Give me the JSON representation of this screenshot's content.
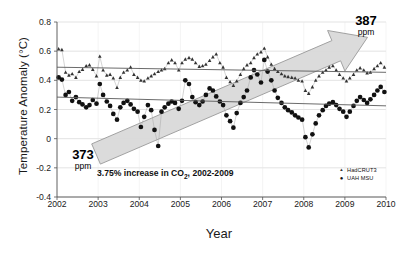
{
  "chart_data": {
    "type": "scatter",
    "title": "",
    "xlabel": "Year",
    "ylabel": "Temperature Anomaly (°C)",
    "xlim": [
      2002,
      2010
    ],
    "ylim": [
      -0.4,
      0.8
    ],
    "xticks": [
      "2002",
      "2003",
      "2004",
      "2005",
      "2006",
      "2007",
      "2008",
      "2009",
      "2010"
    ],
    "yticks": [
      "0.8",
      "0.6",
      "0.4",
      "0.2",
      "0",
      "-0.2",
      "-0.4"
    ],
    "grid": true,
    "legend_position": "bottom-right",
    "legend": [
      {
        "label": "HadCRUT3",
        "marker": "small-triangle",
        "color": "#333333"
      },
      {
        "label": "UAH MSU",
        "marker": "filled-circle",
        "color": "#111111"
      }
    ],
    "annotations": [
      {
        "name": "co2-start",
        "value": "373",
        "unit": "ppm",
        "text": "373 ppm"
      },
      {
        "name": "co2-end",
        "value": "387",
        "unit": "ppm",
        "text": "387 ppm"
      },
      {
        "name": "caption",
        "text": "3.75% increase in CO2, 2002-2009",
        "prefix": "3.75% increase in CO",
        "sub": "2",
        "suffix": ", 2002-2009"
      }
    ],
    "arrow": {
      "label": "co2-increase-arrow",
      "from": [
        2002.95,
        -0.105
      ],
      "to": [
        2009.55,
        0.695
      ],
      "color": "#d9d9d9"
    },
    "trendlines": [
      {
        "series": "HadCRUT3",
        "from": [
          2002,
          0.49
        ],
        "to": [
          2010,
          0.455
        ],
        "color": "#5a5a5a"
      },
      {
        "series": "UAH MSU",
        "from": [
          2002,
          0.285
        ],
        "to": [
          2010,
          0.225
        ],
        "color": "#5a5a5a"
      }
    ],
    "series": [
      {
        "name": "HadCRUT3",
        "marker": "small-triangle",
        "color": "#333333",
        "x": [
          2002.04,
          2002.12,
          2002.21,
          2002.29,
          2002.37,
          2002.46,
          2002.54,
          2002.62,
          2002.71,
          2002.79,
          2002.87,
          2002.96,
          2003.04,
          2003.12,
          2003.21,
          2003.29,
          2003.37,
          2003.46,
          2003.54,
          2003.62,
          2003.71,
          2003.79,
          2003.87,
          2003.96,
          2004.04,
          2004.12,
          2004.21,
          2004.29,
          2004.37,
          2004.46,
          2004.54,
          2004.62,
          2004.71,
          2004.79,
          2004.87,
          2004.96,
          2005.04,
          2005.12,
          2005.21,
          2005.29,
          2005.37,
          2005.46,
          2005.54,
          2005.62,
          2005.71,
          2005.79,
          2005.87,
          2005.96,
          2006.04,
          2006.12,
          2006.21,
          2006.29,
          2006.37,
          2006.46,
          2006.54,
          2006.62,
          2006.71,
          2006.79,
          2006.87,
          2006.96,
          2007.04,
          2007.12,
          2007.21,
          2007.29,
          2007.37,
          2007.46,
          2007.54,
          2007.62,
          2007.71,
          2007.79,
          2007.87,
          2007.96,
          2008.04,
          2008.12,
          2008.21,
          2008.29,
          2008.37,
          2008.46,
          2008.54,
          2008.62,
          2008.71,
          2008.79,
          2008.87,
          2008.96,
          2009.04,
          2009.12,
          2009.21,
          2009.29,
          2009.37,
          2009.46,
          2009.54,
          2009.62,
          2009.71,
          2009.79,
          2009.87,
          2009.96
        ],
        "y": [
          0.615,
          0.61,
          0.455,
          0.435,
          0.445,
          0.42,
          0.46,
          0.475,
          0.5,
          0.505,
          0.475,
          0.43,
          0.565,
          0.47,
          0.435,
          0.44,
          0.415,
          0.35,
          0.42,
          0.455,
          0.47,
          0.49,
          0.44,
          0.42,
          0.4,
          0.395,
          0.415,
          0.43,
          0.445,
          0.46,
          0.47,
          0.48,
          0.52,
          0.54,
          0.52,
          0.47,
          0.52,
          0.545,
          0.555,
          0.545,
          0.52,
          0.495,
          0.5,
          0.51,
          0.535,
          0.56,
          0.58,
          0.52,
          0.49,
          0.42,
          0.39,
          0.365,
          0.395,
          0.44,
          0.48,
          0.505,
          0.52,
          0.555,
          0.58,
          0.595,
          0.62,
          0.56,
          0.51,
          0.48,
          0.46,
          0.445,
          0.43,
          0.425,
          0.42,
          0.415,
          0.4,
          0.395,
          0.33,
          0.31,
          0.355,
          0.4,
          0.43,
          0.455,
          0.47,
          0.49,
          0.5,
          0.47,
          0.44,
          0.415,
          0.395,
          0.415,
          0.44,
          0.47,
          0.485,
          0.47,
          0.45,
          0.455,
          0.48,
          0.5,
          0.52,
          0.49
        ]
      },
      {
        "name": "UAH MSU",
        "marker": "filled-circle",
        "color": "#111111",
        "x": [
          2002.04,
          2002.12,
          2002.21,
          2002.29,
          2002.37,
          2002.46,
          2002.54,
          2002.62,
          2002.71,
          2002.79,
          2002.87,
          2002.96,
          2003.04,
          2003.12,
          2003.21,
          2003.29,
          2003.37,
          2003.46,
          2003.54,
          2003.62,
          2003.71,
          2003.79,
          2003.87,
          2003.96,
          2004.04,
          2004.12,
          2004.21,
          2004.29,
          2004.37,
          2004.46,
          2004.54,
          2004.62,
          2004.71,
          2004.79,
          2004.87,
          2004.96,
          2005.04,
          2005.12,
          2005.21,
          2005.29,
          2005.37,
          2005.46,
          2005.54,
          2005.62,
          2005.71,
          2005.79,
          2005.87,
          2005.96,
          2006.04,
          2006.12,
          2006.21,
          2006.29,
          2006.37,
          2006.46,
          2006.54,
          2006.62,
          2006.71,
          2006.79,
          2006.87,
          2006.96,
          2007.04,
          2007.12,
          2007.21,
          2007.29,
          2007.37,
          2007.46,
          2007.54,
          2007.62,
          2007.71,
          2007.79,
          2007.87,
          2007.96,
          2008.04,
          2008.12,
          2008.21,
          2008.29,
          2008.37,
          2008.46,
          2008.54,
          2008.62,
          2008.71,
          2008.79,
          2008.87,
          2008.96,
          2009.04,
          2009.12,
          2009.21,
          2009.29,
          2009.37,
          2009.46,
          2009.54,
          2009.62,
          2009.71,
          2009.79,
          2009.87,
          2009.96
        ],
        "y": [
          0.42,
          0.405,
          0.3,
          0.32,
          0.26,
          0.285,
          0.25,
          0.235,
          0.215,
          0.23,
          0.265,
          0.24,
          0.375,
          0.3,
          0.255,
          0.225,
          0.17,
          0.13,
          0.215,
          0.245,
          0.26,
          0.235,
          0.205,
          0.185,
          0.08,
          0.15,
          0.23,
          0.195,
          0.06,
          -0.05,
          0.185,
          0.215,
          0.24,
          0.255,
          0.245,
          0.205,
          0.26,
          0.4,
          0.375,
          0.285,
          0.25,
          0.23,
          0.255,
          0.3,
          0.345,
          0.33,
          0.29,
          0.255,
          0.23,
          0.16,
          0.12,
          0.075,
          0.175,
          0.245,
          0.285,
          0.33,
          0.42,
          0.47,
          0.44,
          0.385,
          0.54,
          0.46,
          0.4,
          0.33,
          0.28,
          0.245,
          0.215,
          0.195,
          0.18,
          0.16,
          0.145,
          0.13,
          0.01,
          -0.06,
          0.03,
          0.105,
          0.16,
          0.195,
          0.225,
          0.24,
          0.25,
          0.23,
          0.205,
          0.185,
          0.15,
          0.185,
          0.225,
          0.26,
          0.285,
          0.265,
          0.245,
          0.27,
          0.3,
          0.33,
          0.355,
          0.32
        ]
      }
    ]
  }
}
